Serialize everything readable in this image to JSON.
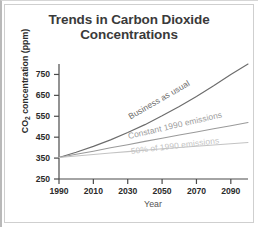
{
  "chart_data": {
    "type": "line",
    "title": "Trends in Carbon Dioxide Concentrations",
    "title_line1": "Trends in Carbon Dioxide",
    "title_line2": "Concentrations",
    "xlabel": "Year",
    "ylabel": "CO2 concentration (ppm)",
    "ylabel_prefix": "CO",
    "ylabel_sub": "2",
    "ylabel_suffix": " concentration (ppm)",
    "xlim": [
      1990,
      2100
    ],
    "ylim": [
      250,
      800
    ],
    "grid": false,
    "legend_position": "inline-curve-labels",
    "xticks": [
      1990,
      2010,
      2030,
      2050,
      2070,
      2090
    ],
    "yticks": [
      250,
      350,
      450,
      550,
      650,
      750
    ],
    "x": [
      1990,
      2000,
      2010,
      2020,
      2030,
      2040,
      2050,
      2060,
      2070,
      2080,
      2090,
      2100
    ],
    "series": [
      {
        "name": "Business as usual",
        "color": "#6c6c6c",
        "values": [
          353,
          378,
          406,
          437,
          472,
          510,
          552,
          597,
          645,
          696,
          750,
          800
        ]
      },
      {
        "name": "Constant 1990 emissions",
        "color": "#9a9a9a",
        "values": [
          353,
          368,
          383,
          399,
          414,
          430,
          445,
          460,
          475,
          490,
          505,
          520
        ]
      },
      {
        "name": "50% of 1990 emissions",
        "color": "#c3c3c3",
        "values": [
          353,
          360,
          367,
          374,
          381,
          388,
          395,
          401,
          407,
          413,
          419,
          425
        ]
      }
    ]
  }
}
